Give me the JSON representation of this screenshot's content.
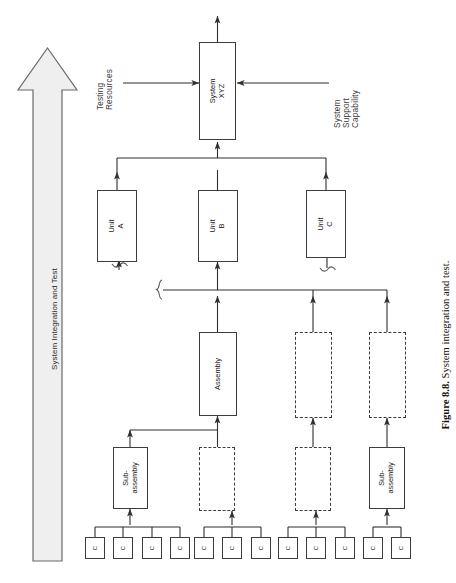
{
  "figure": {
    "caption_label": "Figure 8.8.",
    "caption_text": " System integration and test."
  },
  "process_arrow": {
    "label": "System Integration and Test",
    "direction": "up",
    "fill": "#eeeeee",
    "stroke": "#5a5a5a"
  },
  "external_inputs": [
    {
      "id": "testing-resources",
      "label": "Testing\nResources",
      "side": "left"
    },
    {
      "id": "system-support-capability",
      "label": "System\nSupport\nCapability",
      "side": "right"
    }
  ],
  "nodes": {
    "system": {
      "label": "System XYZ",
      "style": "solid"
    },
    "units": [
      {
        "label": "Unit A",
        "style": "solid"
      },
      {
        "label": "Unit B",
        "style": "solid"
      },
      {
        "label": "Unit C",
        "style": "solid"
      }
    ],
    "assemblies": [
      {
        "label": "Assembly",
        "style": "solid"
      },
      {
        "label": "",
        "style": "dashed"
      },
      {
        "label": "",
        "style": "dashed"
      }
    ],
    "subassemblies": [
      {
        "label": "Sub-assembly",
        "style": "solid"
      },
      {
        "label": "",
        "style": "dashed"
      },
      {
        "label": "",
        "style": "dashed"
      },
      {
        "label": "Sub-\nassembly",
        "style": "solid"
      }
    ],
    "component_label": "C",
    "component_groups": [
      4,
      3,
      3,
      2
    ]
  },
  "colors": {
    "line": "#3c3c3c",
    "box_stroke": "#3c3c3c",
    "text": "#1a1a1a",
    "background": "#ffffff"
  }
}
